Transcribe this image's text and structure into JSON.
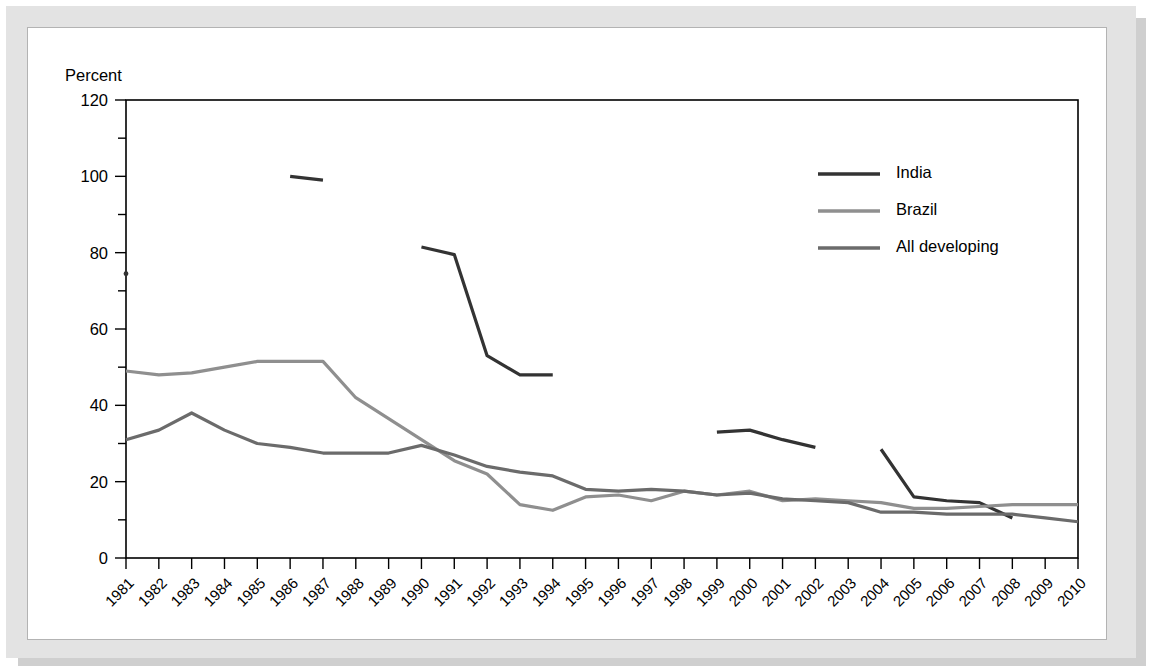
{
  "figure": {
    "background_color": "#e3e3e3",
    "panel_color": "#ffffff",
    "panel_border_color": "#b3b3b3"
  },
  "chart_data": {
    "type": "line",
    "title": "",
    "subtitle": "",
    "xlabel": "",
    "ylabel": "Percent",
    "ylim": [
      0,
      120
    ],
    "yticks": [
      0,
      20,
      40,
      60,
      80,
      100,
      120
    ],
    "grid": false,
    "legend_position": "top-right",
    "x": [
      1981,
      1982,
      1983,
      1984,
      1985,
      1986,
      1987,
      1988,
      1989,
      1990,
      1991,
      1992,
      1993,
      1994,
      1995,
      1996,
      1997,
      1998,
      1999,
      2000,
      2001,
      2002,
      2003,
      2004,
      2005,
      2006,
      2007,
      2008,
      2009,
      2010
    ],
    "categories": [
      "1981",
      "1982",
      "1983",
      "1984",
      "1985",
      "1986",
      "1987",
      "1988",
      "1989",
      "1990",
      "1991",
      "1992",
      "1993",
      "1994",
      "1995",
      "1996",
      "1997",
      "1998",
      "1999",
      "2000",
      "2001",
      "2002",
      "2003",
      "2004",
      "2005",
      "2006",
      "2007",
      "2008",
      "2009",
      "2010"
    ],
    "series": [
      {
        "name": "India",
        "color": "#333333",
        "values": [
          74.5,
          null,
          null,
          null,
          null,
          100.0,
          99.0,
          null,
          null,
          81.5,
          79.5,
          53.0,
          48.0,
          48.0,
          null,
          null,
          34.5,
          null,
          33.0,
          33.5,
          31.0,
          29.0,
          null,
          28.5,
          16.0,
          15.0,
          14.5,
          10.5,
          null,
          null
        ]
      },
      {
        "name": "Brazil",
        "color": "#8f8f8f",
        "values": [
          49.0,
          48.0,
          48.5,
          50.0,
          51.5,
          51.5,
          51.5,
          42.0,
          36.5,
          31.0,
          25.5,
          22.0,
          14.0,
          12.5,
          16.0,
          16.5,
          15.0,
          17.5,
          16.5,
          17.5,
          15.0,
          15.5,
          15.0,
          14.5,
          13.0,
          13.0,
          13.5,
          14.0,
          14.0,
          14.0
        ]
      },
      {
        "name": "All developing",
        "color": "#6b6b6b",
        "values": [
          31.0,
          33.5,
          38.0,
          33.5,
          30.0,
          29.0,
          27.5,
          27.5,
          27.5,
          29.5,
          27.0,
          24.0,
          22.5,
          21.5,
          18.0,
          17.5,
          18.0,
          17.5,
          16.5,
          17.0,
          15.5,
          15.0,
          14.5,
          12.0,
          12.0,
          11.5,
          11.5,
          11.5,
          10.5,
          9.5
        ]
      }
    ],
    "isolated_points": [
      {
        "series": "India",
        "x": 1981,
        "y": 74.5
      }
    ]
  }
}
